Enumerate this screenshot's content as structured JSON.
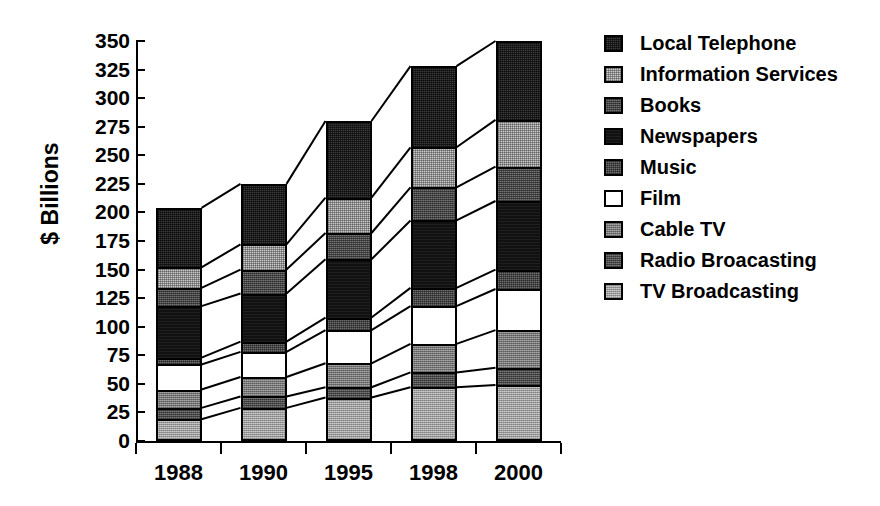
{
  "chart_data": {
    "type": "bar",
    "subtype": "stacked-vertical",
    "title": "",
    "xlabel": "",
    "ylabel": "$ Billions",
    "categories": [
      "1988",
      "1990",
      "1995",
      "1998",
      "2000"
    ],
    "ylim": [
      0,
      350
    ],
    "ytick_step": 25,
    "ytick_labels": [
      "350",
      "325",
      "300",
      "275",
      "250",
      "225",
      "200",
      "175",
      "150",
      "125",
      "100",
      "75",
      "50",
      "25",
      "0"
    ],
    "grid": false,
    "legend_position": "right",
    "connector_lines": true,
    "series": [
      {
        "name": "Local Telephone",
        "color": "#3a3a3a",
        "values": [
          52,
          53,
          67,
          71,
          69
        ]
      },
      {
        "name": "Information Services",
        "color": "#c9c9c9",
        "values": [
          18,
          22,
          31,
          35,
          41
        ]
      },
      {
        "name": "Books",
        "color": "#555555",
        "values": [
          16,
          21,
          23,
          29,
          30
        ]
      },
      {
        "name": "Newspapers",
        "color": "#111111",
        "values": [
          45,
          42,
          51,
          59,
          60
        ]
      },
      {
        "name": "Music",
        "color": "#4a4a4a",
        "values": [
          6,
          9,
          11,
          16,
          17
        ]
      },
      {
        "name": "Film",
        "color": "#ffffff",
        "values": [
          22,
          22,
          29,
          33,
          36
        ]
      },
      {
        "name": "Cable TV",
        "color": "#8d8d8d",
        "values": [
          16,
          17,
          21,
          25,
          33
        ]
      },
      {
        "name": "Radio Broacasting",
        "color": "#5d5d5d",
        "values": [
          10,
          10,
          9,
          13,
          15
        ]
      },
      {
        "name": "TV Broadcasting",
        "color": "#b4b4b4",
        "values": [
          19,
          29,
          38,
          47,
          49
        ]
      }
    ],
    "totals": [
      204,
      225,
      280,
      328,
      350
    ],
    "cumulative_tops": {
      "1988": {
        "TV Broadcasting": 19,
        "Radio Broacasting": 29,
        "Cable TV": 45,
        "Film": 67,
        "Music": 73,
        "Newspapers": 118,
        "Books": 134,
        "Information Services": 152,
        "Local Telephone": 204
      },
      "1990": {
        "TV Broadcasting": 29,
        "Radio Broacasting": 39,
        "Cable TV": 56,
        "Film": 78,
        "Music": 87,
        "Newspapers": 129,
        "Books": 150,
        "Information Services": 172,
        "Local Telephone": 225
      },
      "1995": {
        "TV Broadcasting": 38,
        "Radio Broacasting": 47,
        "Cable TV": 68,
        "Film": 97,
        "Music": 108,
        "Newspapers": 159,
        "Books": 182,
        "Information Services": 213,
        "Local Telephone": 280
      },
      "1998": {
        "TV Broadcasting": 47,
        "Radio Broacasting": 60,
        "Cable TV": 85,
        "Film": 118,
        "Music": 134,
        "Newspapers": 193,
        "Books": 222,
        "Information Services": 257,
        "Local Telephone": 328
      },
      "2000": {
        "TV Broadcasting": 49,
        "Radio Broacasting": 64,
        "Cable TV": 97,
        "Film": 133,
        "Music": 150,
        "Newspapers": 210,
        "Books": 240,
        "Information Services": 281,
        "Local Telephone": 350
      }
    }
  },
  "legend": {
    "items": [
      {
        "label": "Local Telephone",
        "swatch": "f-localtel"
      },
      {
        "label": "Information Services",
        "swatch": "f-infosvc"
      },
      {
        "label": "Books",
        "swatch": "f-books"
      },
      {
        "label": "Newspapers",
        "swatch": "f-news"
      },
      {
        "label": "Music",
        "swatch": "f-music"
      },
      {
        "label": "Film",
        "swatch": "f-film"
      },
      {
        "label": "Cable TV",
        "swatch": "f-cable"
      },
      {
        "label": "Radio Broacasting",
        "swatch": "f-radio"
      },
      {
        "label": "TV Broadcasting",
        "swatch": "f-tvbc"
      }
    ]
  },
  "axis": {
    "y_title": "$ Billions"
  }
}
